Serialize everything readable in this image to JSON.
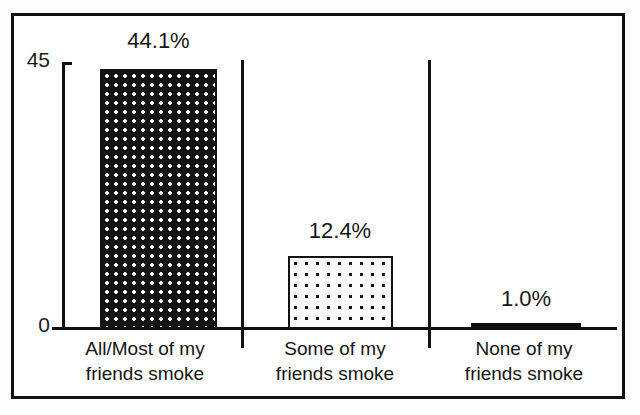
{
  "chart_data": {
    "type": "bar",
    "title": "",
    "xlabel": "",
    "ylabel": "",
    "categories": [
      "All/Most of my friends smoke",
      "Some of my friends smoke",
      "None of my friends smoke"
    ],
    "category_lines": [
      [
        "All/Most of my",
        "friends smoke"
      ],
      [
        "Some of my",
        "friends smoke"
      ],
      [
        "None of my",
        "friends smoke"
      ]
    ],
    "values": [
      44.1,
      12.4,
      1.0
    ],
    "data_labels": [
      "44.1%",
      "12.4%",
      "1.0%"
    ],
    "ylim": [
      0,
      45
    ],
    "ytick_labels": [
      "45",
      "0"
    ],
    "yticks": [
      45,
      0
    ],
    "grid": false,
    "legend": null,
    "bar_fills": [
      "dark-with-white-dots",
      "white-with-black-dots",
      "solid-black"
    ],
    "colors": {
      "bar_1_background": "#141414",
      "bar_1_dots": "#ffffff",
      "bar_2_background": "#fcfcfc",
      "bar_2_dots": "#121212",
      "bar_3_fill": "#101010",
      "axis": "#111111",
      "text": "#161616",
      "frame": "#111111",
      "page_background": "#ffffff"
    }
  },
  "axis": {
    "y_top_label": "45",
    "y_zero_label": "0"
  },
  "bars": [
    {
      "label": "44.1%",
      "category_line_1": "All/Most of my",
      "category_line_2": "friends smoke"
    },
    {
      "label": "12.4%",
      "category_line_1": "Some of my",
      "category_line_2": "friends smoke"
    },
    {
      "label": "1.0%",
      "category_line_1": "None of my",
      "category_line_2": "friends smoke"
    }
  ]
}
